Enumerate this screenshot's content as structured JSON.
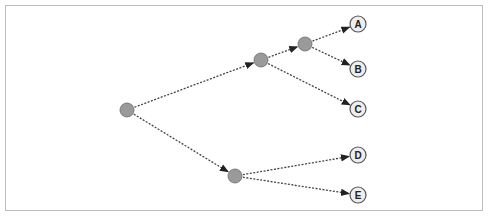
{
  "diagram": {
    "type": "tree",
    "colors": {
      "inner_node": "#9a9a9a",
      "inner_stroke": "#6a6a6a",
      "leaf_fill": "#eeeeee",
      "leaf_stroke": "#555555",
      "edge": "#444444",
      "frame": "#bdbdbd"
    },
    "nodes": [
      {
        "id": "root",
        "label": "",
        "x": 127,
        "y": 110,
        "kind": "inner"
      },
      {
        "id": "n1",
        "label": "",
        "x": 261,
        "y": 60,
        "kind": "inner"
      },
      {
        "id": "n2",
        "label": "",
        "x": 305,
        "y": 44,
        "kind": "inner"
      },
      {
        "id": "n3",
        "label": "",
        "x": 235,
        "y": 176,
        "kind": "inner"
      },
      {
        "id": "A",
        "label": "A",
        "x": 358,
        "y": 24,
        "kind": "leaf"
      },
      {
        "id": "B",
        "label": "B",
        "x": 358,
        "y": 69,
        "kind": "leaf"
      },
      {
        "id": "C",
        "label": "C",
        "x": 358,
        "y": 109,
        "kind": "leaf"
      },
      {
        "id": "D",
        "label": "D",
        "x": 358,
        "y": 155,
        "kind": "leaf"
      },
      {
        "id": "E",
        "label": "E",
        "x": 358,
        "y": 195,
        "kind": "leaf"
      }
    ],
    "edges": [
      {
        "from": "root",
        "to": "n1"
      },
      {
        "from": "root",
        "to": "n3"
      },
      {
        "from": "n1",
        "to": "n2"
      },
      {
        "from": "n1",
        "to": "C"
      },
      {
        "from": "n2",
        "to": "A"
      },
      {
        "from": "n2",
        "to": "B"
      },
      {
        "from": "n3",
        "to": "D"
      },
      {
        "from": "n3",
        "to": "E"
      }
    ]
  }
}
